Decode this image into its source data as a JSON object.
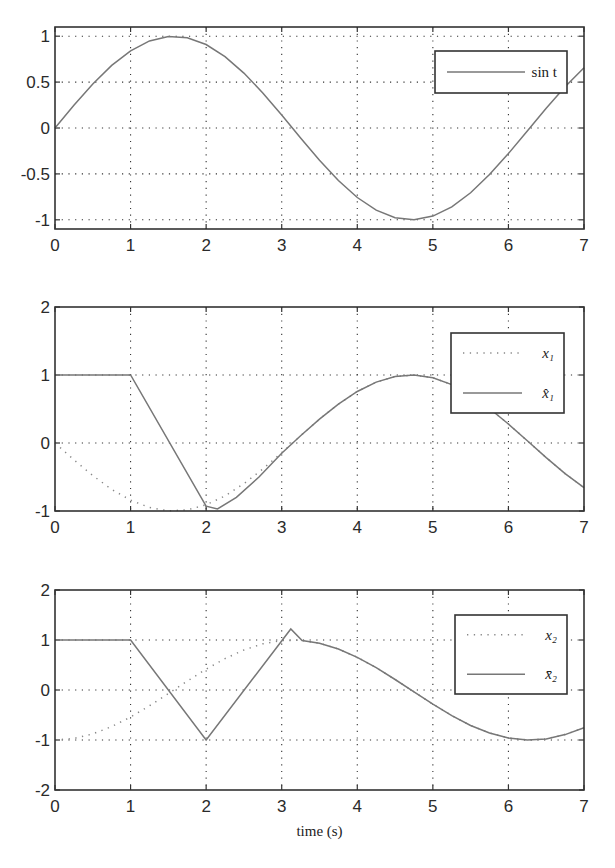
{
  "chart_data": [
    {
      "type": "line",
      "title": "",
      "xlabel": "",
      "ylabel": "",
      "xlim": [
        0,
        7
      ],
      "ylim": [
        -1.1,
        1.1
      ],
      "xticks": [
        0,
        1,
        2,
        3,
        4,
        5,
        6,
        7
      ],
      "yticks": [
        -1,
        -0.5,
        0,
        0.5,
        1
      ],
      "ytick_labels": [
        "-1",
        "-0.5",
        "0",
        "0.5",
        "1"
      ],
      "grid": true,
      "legend_position": "top-right",
      "series": [
        {
          "name": "sin t",
          "style": "solid",
          "x": [
            0,
            0.25,
            0.5,
            0.75,
            1,
            1.25,
            1.5,
            1.75,
            2,
            2.25,
            2.5,
            2.75,
            3,
            3.25,
            3.5,
            3.75,
            4,
            4.25,
            4.5,
            4.75,
            5,
            5.25,
            5.5,
            5.75,
            6,
            6.25,
            6.5,
            6.75,
            7
          ],
          "y": [
            0,
            0.247,
            0.479,
            0.682,
            0.841,
            0.949,
            0.997,
            0.984,
            0.909,
            0.778,
            0.598,
            0.382,
            0.141,
            -0.108,
            -0.351,
            -0.572,
            -0.757,
            -0.895,
            -0.978,
            -0.999,
            -0.959,
            -0.859,
            -0.706,
            -0.508,
            -0.279,
            -0.033,
            0.215,
            0.45,
            0.657
          ]
        }
      ]
    },
    {
      "type": "line",
      "title": "",
      "xlabel": "",
      "ylabel": "",
      "xlim": [
        0,
        7
      ],
      "ylim": [
        -1,
        2
      ],
      "xticks": [
        0,
        1,
        2,
        3,
        4,
        5,
        6,
        7
      ],
      "yticks": [
        -1,
        0,
        1,
        2
      ],
      "ytick_labels": [
        "-1",
        "0",
        "1",
        "2"
      ],
      "grid": true,
      "legend_position": "top-right",
      "series": [
        {
          "name": "x₁",
          "style": "dotted",
          "x": [
            0,
            0.25,
            0.5,
            0.75,
            1,
            1.25,
            1.5,
            1.75,
            2,
            2.25,
            2.5,
            2.75,
            3,
            3.25,
            3.5,
            3.75,
            4,
            4.25,
            4.5,
            4.75,
            5,
            5.25,
            5.5,
            5.75,
            6,
            6.25,
            6.5,
            6.75,
            7
          ],
          "y": [
            0,
            -0.247,
            -0.479,
            -0.682,
            -0.841,
            -0.949,
            -0.997,
            -0.984,
            -0.909,
            -0.778,
            -0.598,
            -0.382,
            -0.141,
            0.108,
            0.351,
            0.572,
            0.757,
            0.895,
            0.978,
            0.999,
            0.959,
            0.859,
            0.706,
            0.508,
            0.279,
            0.033,
            -0.215,
            -0.45,
            -0.657
          ]
        },
        {
          "name": "x̂₁",
          "style": "solid",
          "x": [
            0,
            1,
            2,
            2.15,
            2.4,
            2.7,
            3.0,
            3.25,
            3.5,
            3.75,
            4,
            4.25,
            4.5,
            4.75,
            5,
            5.25,
            5.5,
            5.75,
            6,
            6.25,
            6.5,
            6.75,
            7
          ],
          "y": [
            1,
            1,
            -0.93,
            -0.97,
            -0.8,
            -0.5,
            -0.15,
            0.108,
            0.351,
            0.572,
            0.757,
            0.895,
            0.978,
            0.999,
            0.959,
            0.859,
            0.706,
            0.508,
            0.279,
            0.033,
            -0.215,
            -0.45,
            -0.657
          ]
        }
      ]
    },
    {
      "type": "line",
      "title": "",
      "xlabel": "time (s)",
      "ylabel": "",
      "xlim": [
        0,
        7
      ],
      "ylim": [
        -2,
        2
      ],
      "xticks": [
        0,
        1,
        2,
        3,
        4,
        5,
        6,
        7
      ],
      "yticks": [
        -2,
        -1,
        0,
        1,
        2
      ],
      "ytick_labels": [
        "-2",
        "-1",
        "0",
        "1",
        "2"
      ],
      "grid": true,
      "legend_position": "top-right",
      "series": [
        {
          "name": "x₂",
          "style": "dotted",
          "x": [
            0,
            0.25,
            0.5,
            0.75,
            1,
            1.25,
            1.5,
            1.75,
            2,
            2.25,
            2.5,
            2.75,
            3,
            3.25,
            3.5,
            3.75,
            4,
            4.25,
            4.5,
            4.75,
            5,
            5.25,
            5.5,
            5.75,
            6,
            6.25,
            6.5,
            6.75,
            7
          ],
          "y": [
            -1,
            -0.969,
            -0.878,
            -0.732,
            -0.54,
            -0.315,
            -0.071,
            0.178,
            0.416,
            0.628,
            0.801,
            0.924,
            0.99,
            0.994,
            0.936,
            0.82,
            0.654,
            0.446,
            0.211,
            -0.037,
            -0.284,
            -0.512,
            -0.709,
            -0.861,
            -0.96,
            -1,
            -0.977,
            -0.893,
            -0.754
          ]
        },
        {
          "name": "x̄₂",
          "style": "solid",
          "x": [
            0,
            1,
            2,
            3.12,
            3.27,
            3.5,
            3.75,
            4,
            4.25,
            4.5,
            4.75,
            5,
            5.25,
            5.5,
            5.75,
            6,
            6.25,
            6.5,
            6.75,
            7
          ],
          "y": [
            1,
            1,
            -1,
            1.22,
            0.99,
            0.936,
            0.82,
            0.654,
            0.446,
            0.211,
            -0.037,
            -0.284,
            -0.512,
            -0.709,
            -0.861,
            -0.96,
            -1,
            -0.977,
            -0.893,
            -0.754
          ]
        }
      ]
    }
  ]
}
